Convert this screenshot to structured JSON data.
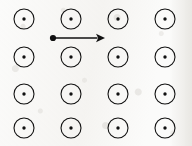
{
  "figure": {
    "title": "Uniform magnetic field out of the page with a rightward velocity vector",
    "background_color": "#fbfbfa",
    "ink_color": "#111111",
    "width": 192,
    "height": 146
  },
  "field": {
    "symbol_name": "field-out-of-page",
    "symbol_description": "circle with filled center dot",
    "rows": 4,
    "columns": 4,
    "count": 16,
    "circle_radius": 10,
    "circle_stroke_width": 1.1,
    "center_dot_radius": 1.7,
    "column_centers_x": [
      24,
      71,
      118,
      165
    ],
    "row_centers_y": [
      19,
      57,
      94,
      128
    ],
    "markers": [
      {
        "row": 1,
        "col": 1,
        "cx": 24,
        "cy": 19
      },
      {
        "row": 1,
        "col": 2,
        "cx": 71,
        "cy": 19
      },
      {
        "row": 1,
        "col": 3,
        "cx": 118,
        "cy": 19
      },
      {
        "row": 1,
        "col": 4,
        "cx": 165,
        "cy": 19
      },
      {
        "row": 2,
        "col": 1,
        "cx": 24,
        "cy": 57
      },
      {
        "row": 2,
        "col": 2,
        "cx": 71,
        "cy": 57
      },
      {
        "row": 2,
        "col": 3,
        "cx": 118,
        "cy": 57
      },
      {
        "row": 2,
        "col": 4,
        "cx": 165,
        "cy": 57
      },
      {
        "row": 3,
        "col": 1,
        "cx": 24,
        "cy": 94
      },
      {
        "row": 3,
        "col": 2,
        "cx": 71,
        "cy": 94
      },
      {
        "row": 3,
        "col": 3,
        "cx": 118,
        "cy": 94
      },
      {
        "row": 3,
        "col": 4,
        "cx": 165,
        "cy": 94
      },
      {
        "row": 4,
        "col": 1,
        "cx": 24,
        "cy": 128
      },
      {
        "row": 4,
        "col": 2,
        "cx": 71,
        "cy": 128
      },
      {
        "row": 4,
        "col": 3,
        "cx": 118,
        "cy": 128
      },
      {
        "row": 4,
        "col": 4,
        "cx": 165,
        "cy": 128
      }
    ]
  },
  "vector": {
    "name": "velocity-arrow",
    "direction": "right",
    "label": "",
    "origin_dot_radius": 3.1,
    "start_x": 53,
    "start_y": 38,
    "end_x": 105,
    "end_y": 38,
    "shaft_stroke_width": 1.6,
    "arrowhead_length": 9,
    "arrowhead_half_width": 4.2
  }
}
